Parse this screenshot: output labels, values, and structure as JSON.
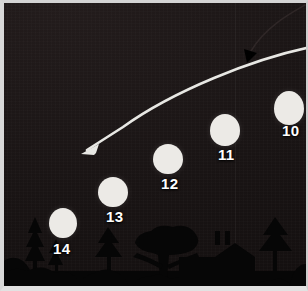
{
  "scene": {
    "title": "Night sky balloon sequence",
    "kind": "night-landscape-photo-illustration",
    "width": 308,
    "height": 291,
    "colors": {
      "sky": "#191414",
      "silhouette": "#060606",
      "balloon": "#eceae6",
      "label_text": "#ffffff",
      "white_arrow": "#e8e8e4",
      "dark_arrow": "#2a2424",
      "frame": "#d8d8d8"
    }
  },
  "balloons": [
    {
      "label": "10",
      "cx": 286,
      "cy": 105,
      "rx": 15,
      "ry": 17,
      "label_x": 280,
      "label_y": 122,
      "occluded": false,
      "clipped_right": true
    },
    {
      "label": "11",
      "cx": 222,
      "cy": 127,
      "rx": 15,
      "ry": 16,
      "label_x": 215,
      "label_y": 145,
      "occluded": false,
      "clipped_right": false
    },
    {
      "label": "12",
      "cx": 165,
      "cy": 156,
      "rx": 15,
      "ry": 15,
      "label_x": 158,
      "label_y": 174,
      "occluded": false,
      "clipped_right": false
    },
    {
      "label": "13",
      "cx": 110,
      "cy": 189,
      "rx": 15,
      "ry": 15,
      "label_x": 103,
      "label_y": 208,
      "occluded": false,
      "clipped_right": false
    },
    {
      "label": "14",
      "cx": 60,
      "cy": 220,
      "rx": 14,
      "ry": 15,
      "label_x": 51,
      "label_y": 243,
      "occluded": true,
      "clipped_right": false
    }
  ],
  "annotations": {
    "white_trajectory": {
      "name": "motion-trajectory-arrow",
      "description": "thick white curved arrow sweeping from upper right to lower left",
      "path": "M 308 44 C 250 56, 170 88, 120 124 L 82 148",
      "stroke_width": 2.6,
      "arrowhead_at": [
        82,
        148
      ],
      "arrowhead_angle_deg": 216
    },
    "dark_pointer": {
      "name": "dark-pointer-arrow",
      "description": "thin dark curve with solid arrowhead descending from the top right corner",
      "path": "M 300 3 C 288 10, 262 24, 248 48",
      "stroke_width": 1.4,
      "arrowhead_at": [
        245,
        56
      ],
      "arrowhead_angle_deg": 250
    }
  },
  "horizon": {
    "name": "tree-and-house-skyline",
    "baseline_y": 288,
    "elements": [
      {
        "type": "conifer-tree",
        "x": 16,
        "base_y": 288,
        "width": 30,
        "height": 76
      },
      {
        "type": "conifer-tree",
        "x": 44,
        "base_y": 288,
        "width": 26,
        "height": 62
      },
      {
        "type": "shrub-mound",
        "x": 0,
        "base_y": 288,
        "width": 34,
        "height": 34
      },
      {
        "type": "conifer-tree",
        "x": 88,
        "base_y": 288,
        "width": 34,
        "height": 56
      },
      {
        "type": "umbrella-pine-tree",
        "x": 132,
        "base_y": 288,
        "width": 64,
        "height": 58
      },
      {
        "type": "house-with-chimneys",
        "x": 172,
        "base_y": 288,
        "width": 88,
        "height": 48
      },
      {
        "type": "conifer-tree",
        "x": 256,
        "base_y": 288,
        "width": 36,
        "height": 66
      },
      {
        "type": "shrub-mound",
        "x": 288,
        "base_y": 288,
        "width": 24,
        "height": 40
      }
    ]
  }
}
